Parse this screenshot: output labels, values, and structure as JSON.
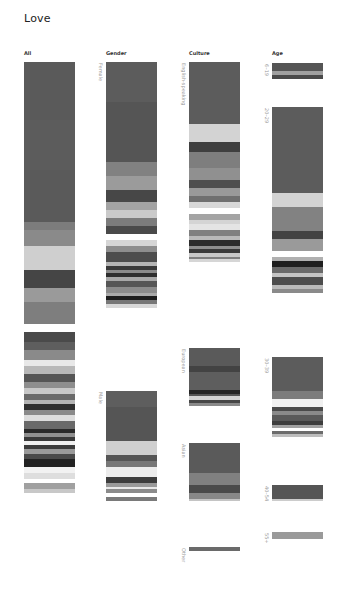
{
  "title": "Love",
  "columns": [
    {
      "key": "all",
      "label": "All",
      "x": 24
    },
    {
      "key": "gender",
      "label": "Gender",
      "x": 106
    },
    {
      "key": "culture",
      "label": "Culture",
      "x": 189
    },
    {
      "key": "age",
      "label": "Age",
      "x": 272
    }
  ],
  "chart_data": {
    "type": "bar",
    "title": "Love",
    "orientation": "stacked segmented bars (grayscale heatmap-like strips)",
    "columns": [
      "All",
      "Gender",
      "Culture",
      "Age"
    ],
    "groups": {
      "All": [
        {
          "label": "",
          "y": 62,
          "width": 51,
          "segments": [
            [
              "#5a5a5a",
              58
            ],
            [
              "#5c5c5c",
              50
            ],
            [
              "#5a5a5a",
              52
            ],
            [
              "#7c7c7c",
              8
            ],
            [
              "#8a8a8a",
              16
            ],
            [
              "#cfcfcf",
              24
            ],
            [
              "#454545",
              18
            ],
            [
              "#9a9a9a",
              14
            ],
            [
              "#7e7e7e",
              22
            ],
            [
              "#ffffff",
              8
            ],
            [
              "#4a4a4a",
              10
            ],
            [
              "#5e5e5e",
              8
            ],
            [
              "#8a8a8a",
              10
            ],
            [
              "#e8e8e8",
              6
            ],
            [
              "#b8b8b8",
              8
            ],
            [
              "#555555",
              8
            ],
            [
              "#8e8e8e",
              6
            ],
            [
              "#c8c8c8",
              6
            ],
            [
              "#6a6a6a",
              6
            ],
            [
              "#b5b5b5",
              4
            ],
            [
              "#303030",
              6
            ],
            [
              "#8a8a8a",
              5
            ],
            [
              "#dddddd",
              6
            ],
            [
              "#6a6a6a",
              8
            ],
            [
              "#2a2a2a",
              4
            ],
            [
              "#909090",
              4
            ],
            [
              "#3a3a3a",
              4
            ],
            [
              "#f0f0f0",
              4
            ],
            [
              "#3c3c3c",
              4
            ],
            [
              "#9a9a9a",
              5
            ],
            [
              "#4a4a4a",
              5
            ],
            [
              "#222222",
              8
            ],
            [
              "#f2f2f2",
              6
            ],
            [
              "#dedede",
              6
            ],
            [
              "#ffffff",
              4
            ],
            [
              "#a0a0a0",
              6
            ],
            [
              "#c8c8c8",
              4
            ]
          ]
        }
      ],
      "Gender": [
        {
          "label": "Female",
          "y": 62,
          "width": 51,
          "segments": [
            [
              "#5c5c5c",
              40
            ],
            [
              "#555555",
              60
            ],
            [
              "#818181",
              14
            ],
            [
              "#9b9b9b",
              14
            ],
            [
              "#474747",
              12
            ],
            [
              "#a3a3a3",
              8
            ],
            [
              "#cacaca",
              8
            ],
            [
              "#7c7c7c",
              8
            ],
            [
              "#4a4a4a",
              8
            ],
            [
              "#ffffff",
              6
            ],
            [
              "#d6d6d6",
              6
            ],
            [
              "#8e8e8e",
              6
            ],
            [
              "#4d4d4d",
              10
            ],
            [
              "#b5b5b5",
              4
            ],
            [
              "#3a3a3a",
              4
            ],
            [
              "#8a8a8a",
              3
            ],
            [
              "#2e2e2e",
              4
            ],
            [
              "#a8a8a8",
              4
            ],
            [
              "#565656",
              6
            ],
            [
              "#8c8c8c",
              6
            ],
            [
              "#aaaaaa",
              3
            ],
            [
              "#1e1e1e",
              4
            ],
            [
              "#777777",
              4
            ],
            [
              "#d8d8d8",
              4
            ]
          ]
        },
        {
          "label": "Male",
          "y": 391,
          "width": 51,
          "segments": [
            [
              "#5e5e5e",
              16
            ],
            [
              "#555555",
              34
            ],
            [
              "#cfcfcf",
              14
            ],
            [
              "#555555",
              6
            ],
            [
              "#777777",
              6
            ],
            [
              "#ececec",
              10
            ],
            [
              "#3d3d3d",
              6
            ],
            [
              "#9a9a9a",
              4
            ],
            [
              "#e9e9e9",
              2
            ],
            [
              "#8b8b8b",
              4
            ],
            [
              "#ffffff",
              4
            ],
            [
              "#7a7a7a",
              4
            ]
          ]
        }
      ],
      "Culture": [
        {
          "label": "English-speaking",
          "y": 62,
          "width": 51,
          "segments": [
            [
              "#5c5c5c",
              62
            ],
            [
              "#d3d3d3",
              18
            ],
            [
              "#3f3f3f",
              10
            ],
            [
              "#7e7e7e",
              16
            ],
            [
              "#909090",
              12
            ],
            [
              "#4f4f4f",
              8
            ],
            [
              "#9a9a9a",
              8
            ],
            [
              "#707070",
              6
            ],
            [
              "#d8d8d8",
              6
            ],
            [
              "#ffffff",
              6
            ],
            [
              "#a4a4a4",
              6
            ],
            [
              "#d4d4d4",
              4
            ],
            [
              "#e4e4e4",
              6
            ],
            [
              "#7f7f7f",
              6
            ],
            [
              "#b8b8b8",
              4
            ],
            [
              "#2c2c2c",
              6
            ],
            [
              "#8e8e8e",
              3
            ],
            [
              "#3a3a3a",
              4
            ],
            [
              "#c8c8c8",
              4
            ],
            [
              "#7f7f7f",
              2
            ],
            [
              "#d6d6d6",
              3
            ]
          ]
        },
        {
          "label": "European",
          "y": 348,
          "width": 51,
          "segments": [
            [
              "#5a5a5a",
              18
            ],
            [
              "#434343",
              6
            ],
            [
              "#5e5e5e",
              18
            ],
            [
              "#252525",
              4
            ],
            [
              "#555555",
              2
            ],
            [
              "#d3d3d3",
              4
            ],
            [
              "#474747",
              3
            ],
            [
              "#8a8a8a",
              3
            ]
          ]
        },
        {
          "label": "Asian",
          "y": 443,
          "width": 51,
          "segments": [
            [
              "#5a5a5a",
              30
            ],
            [
              "#808080",
              12
            ],
            [
              "#4a4a4a",
              8
            ],
            [
              "#888888",
              6
            ],
            [
              "#c4c4c4",
              2
            ]
          ]
        },
        {
          "label": "Other",
          "y": 547,
          "width": 51,
          "segments": [
            [
              "#6a6a6a",
              4
            ]
          ]
        }
      ],
      "Age": [
        {
          "label": "6–19",
          "y": 63,
          "width": 51,
          "segments": [
            [
              "#555555",
              8
            ],
            [
              "#a0a0a0",
              4
            ],
            [
              "#4a4a4a",
              4
            ]
          ]
        },
        {
          "label": "20–29",
          "y": 107,
          "width": 51,
          "segments": [
            [
              "#5c5c5c",
              86
            ],
            [
              "#d3d3d3",
              14
            ],
            [
              "#828282",
              24
            ],
            [
              "#434343",
              8
            ],
            [
              "#9a9a9a",
              12
            ],
            [
              "#ffffff",
              6
            ],
            [
              "#b0b0b0",
              4
            ],
            [
              "#1e1e1e",
              6
            ],
            [
              "#6a6a6a",
              6
            ],
            [
              "#c4c4c4",
              4
            ],
            [
              "#4d4d4d",
              8
            ],
            [
              "#bababa",
              4
            ],
            [
              "#8a8a8a",
              4
            ]
          ]
        },
        {
          "label": "30–39",
          "y": 357,
          "width": 51,
          "segments": [
            [
              "#5c5c5c",
              34
            ],
            [
              "#7c7c7c",
              8
            ],
            [
              "#f0f0f0",
              8
            ],
            [
              "#4a4a4a",
              4
            ],
            [
              "#8a8a8a",
              4
            ],
            [
              "#5a5a5a",
              6
            ],
            [
              "#3e3e3e",
              4
            ],
            [
              "#a2a2a2",
              3
            ],
            [
              "#ffffff",
              3
            ],
            [
              "#6c6c6c",
              3
            ],
            [
              "#bdbdbd",
              3
            ]
          ]
        },
        {
          "label": "40–54",
          "y": 485,
          "width": 51,
          "segments": [
            [
              "#555555",
              14
            ],
            [
              "#cccccc",
              2
            ]
          ]
        },
        {
          "label": "55+",
          "y": 532,
          "width": 51,
          "segments": [
            [
              "#9a9a9a",
              7
            ]
          ]
        }
      ]
    }
  }
}
